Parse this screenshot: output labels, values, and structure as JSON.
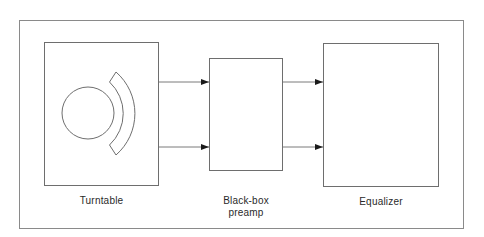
{
  "diagram": {
    "colors": {
      "line": "#7a7a7a",
      "arrowhead": "#1a1a1a",
      "background": "#ffffff"
    },
    "blocks": [
      {
        "id": "turntable",
        "label": "Turntable"
      },
      {
        "id": "preamp",
        "label_line1": "Black-box",
        "label_line2": "preamp"
      },
      {
        "id": "equalizer",
        "label": "Equalizer"
      }
    ],
    "connections": [
      {
        "from": "turntable",
        "to": "preamp",
        "count": 2
      },
      {
        "from": "preamp",
        "to": "equalizer",
        "count": 2
      }
    ]
  }
}
